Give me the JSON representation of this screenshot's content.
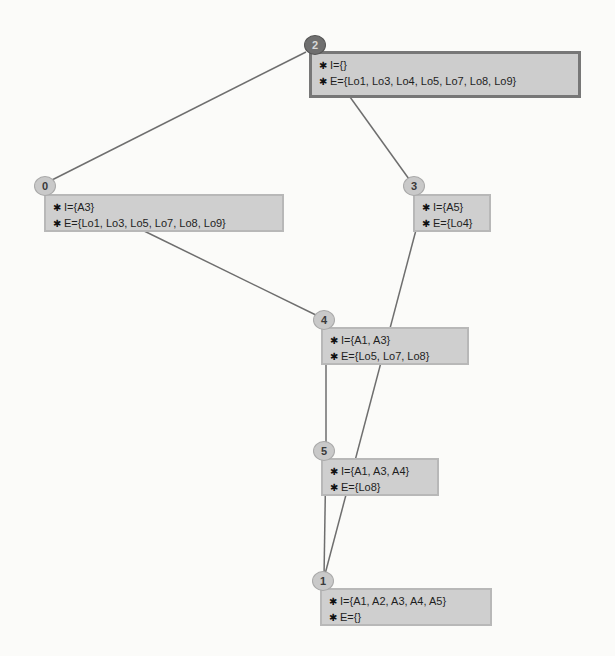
{
  "diagram": {
    "type": "concept-lattice",
    "colors": {
      "root_circle": "#6f6f6f",
      "circle": "#c9c9c9",
      "box": "#cfcfcf",
      "root_box_border": "#777777",
      "edge": "#6e6e6e"
    },
    "marker_icon": "bug-icon",
    "nodes": [
      {
        "id": "2",
        "intent": "I={}",
        "extent": "E={Lo1, Lo3, Lo4, Lo5, Lo7, Lo8, Lo9}"
      },
      {
        "id": "0",
        "intent": "I={A3}",
        "extent": "E={Lo1, Lo3, Lo5, Lo7, Lo8, Lo9}"
      },
      {
        "id": "3",
        "intent": "I={A5}",
        "extent": "E={Lo4}"
      },
      {
        "id": "4",
        "intent": "I={A1, A3}",
        "extent": "E={Lo5, Lo7, Lo8}"
      },
      {
        "id": "5",
        "intent": "I={A1, A3, A4}",
        "extent": "E={Lo8}"
      },
      {
        "id": "1",
        "intent": "I={A1, A2, A3, A4, A5}",
        "extent": "E={}"
      }
    ],
    "edges": [
      {
        "from": "2",
        "to": "0"
      },
      {
        "from": "2",
        "to": "3"
      },
      {
        "from": "0",
        "to": "4"
      },
      {
        "from": "4",
        "to": "5"
      },
      {
        "from": "5",
        "to": "1"
      },
      {
        "from": "3",
        "to": "1"
      }
    ]
  }
}
